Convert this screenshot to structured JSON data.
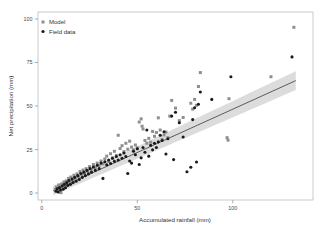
{
  "chart_data": {
    "type": "scatter",
    "title": "",
    "xlabel": "Accumulated rainfall (mm)",
    "ylabel": "Net precipitation (mm)",
    "xlim": [
      -2,
      142
    ],
    "ylim": [
      -4,
      104
    ],
    "xticks": [
      0,
      50,
      100
    ],
    "xtick_labels": [
      "0",
      "50",
      "100"
    ],
    "yticks": [
      0,
      25,
      50,
      75,
      100
    ],
    "ytick_labels": [
      "0",
      "25",
      "50",
      "75",
      "100"
    ],
    "grid": false,
    "legend_position": "top-left",
    "legend": [
      {
        "name": "Model",
        "marker": "square",
        "color": "#8f8f8f"
      },
      {
        "name": "Field data",
        "marker": "circle",
        "color": "#1a1a1a"
      }
    ],
    "series": [
      {
        "name": "Model",
        "marker": "square",
        "color": "#8f8f8f",
        "points": [
          [
            7.0,
            2.0
          ],
          [
            7.6,
            3.4
          ],
          [
            8.2,
            1.2
          ],
          [
            8.8,
            4.6
          ],
          [
            9.4,
            2.8
          ],
          [
            10.0,
            0.2
          ],
          [
            10.4,
            5.2
          ],
          [
            11.0,
            3.6
          ],
          [
            11.6,
            6.4
          ],
          [
            12.2,
            4.2
          ],
          [
            12.8,
            7.0
          ],
          [
            13.4,
            5.6
          ],
          [
            14.0,
            8.4
          ],
          [
            14.6,
            6.2
          ],
          [
            15.2,
            9.2
          ],
          [
            16.0,
            7.4
          ],
          [
            16.8,
            10.2
          ],
          [
            17.6,
            8.0
          ],
          [
            18.4,
            11.0
          ],
          [
            19.2,
            9.4
          ],
          [
            20.0,
            12.4
          ],
          [
            20.8,
            10.6
          ],
          [
            21.6,
            13.2
          ],
          [
            22.4,
            11.2
          ],
          [
            23.2,
            14.0
          ],
          [
            24.0,
            12.6
          ],
          [
            25.0,
            15.2
          ],
          [
            26.0,
            13.8
          ],
          [
            27.0,
            16.4
          ],
          [
            28.0,
            14.6
          ],
          [
            29.0,
            17.2
          ],
          [
            30.0,
            15.8
          ],
          [
            31.0,
            18.4
          ],
          [
            32.0,
            16.8
          ],
          [
            33.0,
            19.6
          ],
          [
            34.0,
            21.2
          ],
          [
            35.0,
            18.2
          ],
          [
            36.0,
            22.6
          ],
          [
            37.0,
            20.2
          ],
          [
            38.0,
            24.0
          ],
          [
            39.0,
            21.6
          ],
          [
            40.0,
            33.2
          ],
          [
            41.0,
            25.6
          ],
          [
            42.0,
            27.2
          ],
          [
            43.0,
            23.8
          ],
          [
            44.0,
            28.6
          ],
          [
            45.0,
            25.2
          ],
          [
            46.0,
            29.8
          ],
          [
            47.0,
            26.4
          ],
          [
            48.0,
            24.8
          ],
          [
            49.0,
            27.6
          ],
          [
            50.0,
            26.0
          ],
          [
            51.0,
            40.8
          ],
          [
            52.0,
            42.6
          ],
          [
            52.5,
            38.4
          ],
          [
            53.0,
            36.8
          ],
          [
            54.0,
            30.2
          ],
          [
            55.0,
            28.6
          ],
          [
            56.0,
            31.4
          ],
          [
            57.0,
            29.2
          ],
          [
            58.0,
            35.4
          ],
          [
            59.0,
            32.6
          ],
          [
            60.0,
            34.8
          ],
          [
            61.0,
            43.2
          ],
          [
            62.0,
            36.2
          ],
          [
            63.0,
            30.8
          ],
          [
            64.0,
            33.4
          ],
          [
            65.0,
            35.0
          ],
          [
            66.0,
            31.8
          ],
          [
            67.0,
            44.2
          ],
          [
            68.0,
            53.2
          ],
          [
            70.0,
            48.8
          ],
          [
            72.0,
            41.6
          ],
          [
            74.0,
            43.4
          ],
          [
            78.0,
            51.6
          ],
          [
            79.0,
            48.2
          ],
          [
            80.0,
            53.8
          ],
          [
            81.0,
            50.4
          ],
          [
            82.0,
            61.2
          ],
          [
            83.0,
            69.2
          ],
          [
            97.0,
            31.8
          ],
          [
            97.5,
            30.4
          ],
          [
            98.0,
            54.2
          ],
          [
            120.0,
            66.8
          ],
          [
            132.0,
            95.2
          ]
        ]
      },
      {
        "name": "Field data",
        "marker": "circle",
        "color": "#1a1a1a",
        "points": [
          [
            7.4,
            1.0
          ],
          [
            8.0,
            2.4
          ],
          [
            8.6,
            0.6
          ],
          [
            9.2,
            3.2
          ],
          [
            9.8,
            1.8
          ],
          [
            10.6,
            4.0
          ],
          [
            11.2,
            2.2
          ],
          [
            11.8,
            5.0
          ],
          [
            12.4,
            3.0
          ],
          [
            13.0,
            6.0
          ],
          [
            13.6,
            4.4
          ],
          [
            14.2,
            7.2
          ],
          [
            15.0,
            5.0
          ],
          [
            15.8,
            8.0
          ],
          [
            16.4,
            6.0
          ],
          [
            17.2,
            9.0
          ],
          [
            18.0,
            6.8
          ],
          [
            18.8,
            10.0
          ],
          [
            19.6,
            7.8
          ],
          [
            20.4,
            11.2
          ],
          [
            21.2,
            9.0
          ],
          [
            22.0,
            12.0
          ],
          [
            22.8,
            10.0
          ],
          [
            23.6,
            13.0
          ],
          [
            24.4,
            11.0
          ],
          [
            25.2,
            14.0
          ],
          [
            26.0,
            12.0
          ],
          [
            27.0,
            15.0
          ],
          [
            28.0,
            13.0
          ],
          [
            29.0,
            16.0
          ],
          [
            30.0,
            14.0
          ],
          [
            31.0,
            17.2
          ],
          [
            32.0,
            8.4
          ],
          [
            33.0,
            18.0
          ],
          [
            34.0,
            16.2
          ],
          [
            35.0,
            19.0
          ],
          [
            36.0,
            17.0
          ],
          [
            37.0,
            20.0
          ],
          [
            38.0,
            18.2
          ],
          [
            39.0,
            21.0
          ],
          [
            40.0,
            19.0
          ],
          [
            41.0,
            22.0
          ],
          [
            42.0,
            20.0
          ],
          [
            43.0,
            23.0
          ],
          [
            44.0,
            21.0
          ],
          [
            45.0,
            11.2
          ],
          [
            46.0,
            18.4
          ],
          [
            47.0,
            17.2
          ],
          [
            48.0,
            24.0
          ],
          [
            49.0,
            22.0
          ],
          [
            50.0,
            25.4
          ],
          [
            51.0,
            16.4
          ],
          [
            52.0,
            20.2
          ],
          [
            53.0,
            26.2
          ],
          [
            54.0,
            23.4
          ],
          [
            55.0,
            36.2
          ],
          [
            56.0,
            21.2
          ],
          [
            57.0,
            27.4
          ],
          [
            58.0,
            24.8
          ],
          [
            59.0,
            28.6
          ],
          [
            60.0,
            26.2
          ],
          [
            61.0,
            29.4
          ],
          [
            62.0,
            33.2
          ],
          [
            63.0,
            30.2
          ],
          [
            64.0,
            35.2
          ],
          [
            65.0,
            22.4
          ],
          [
            66.0,
            31.2
          ],
          [
            68.0,
            44.2
          ],
          [
            69.0,
            19.2
          ],
          [
            70.0,
            46.4
          ],
          [
            72.0,
            40.4
          ],
          [
            74.0,
            32.2
          ],
          [
            76.0,
            12.2
          ],
          [
            78.0,
            14.8
          ],
          [
            79.0,
            42.2
          ],
          [
            80.0,
            49.0
          ],
          [
            81.0,
            17.8
          ],
          [
            82.0,
            51.0
          ],
          [
            83.0,
            58.0
          ],
          [
            89.0,
            53.8
          ],
          [
            99.0,
            66.8
          ],
          [
            131.0,
            78.2
          ]
        ]
      }
    ],
    "fit_line": {
      "name": "regression",
      "color": "#3a3a3a",
      "x_start": 6.0,
      "y_start": 1.4,
      "x_end": 133.0,
      "y_end": 64.6,
      "band_color": "#d0d0d0",
      "band_start_half_width": 2.6,
      "band_end_half_width": 5.4
    }
  }
}
